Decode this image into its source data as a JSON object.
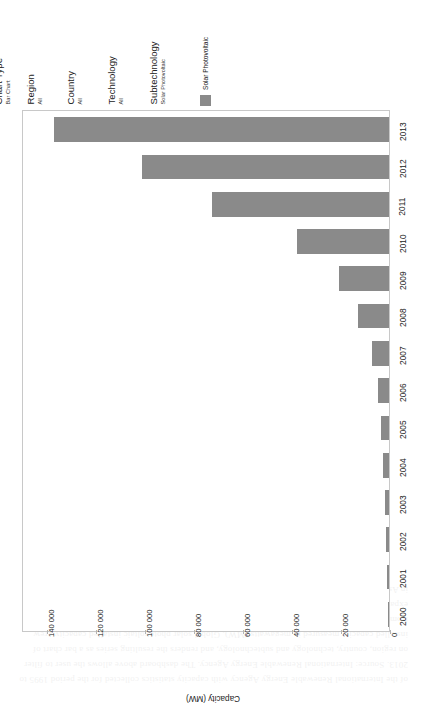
{
  "controls": [
    {
      "caption": "Chart Type",
      "value": "Bar Chart",
      "name": "chart-type"
    },
    {
      "caption": "Region",
      "value": "All",
      "name": "region"
    },
    {
      "caption": "Country",
      "value": "All",
      "name": "country"
    },
    {
      "caption": "Technology",
      "value": "All",
      "name": "technology"
    },
    {
      "caption": "Subtechnology",
      "value": "Solar Photovoltaic",
      "name": "subtechnology"
    }
  ],
  "legend": {
    "label": "Solar Photovoltaic",
    "swatch_color": "#8a8a8a"
  },
  "axis": {
    "value_title": "Capacity (MW)",
    "tick_labels": [
      "140 000",
      "120 000",
      "100 000",
      "80 000",
      "60 000",
      "40 000",
      "20 000",
      "0"
    ]
  },
  "chart_data": {
    "type": "bar",
    "orientation": "horizontal",
    "title": "",
    "subtitle": "",
    "xlabel": "Capacity (MW)",
    "ylabel": "",
    "xlim": [
      0,
      150000
    ],
    "ticks": [
      140000,
      120000,
      100000,
      80000,
      60000,
      40000,
      20000,
      0
    ],
    "grid": false,
    "legend_position": "top",
    "categories": [
      "2013",
      "2012",
      "2011",
      "2010",
      "2009",
      "2008",
      "2007",
      "2006",
      "2005",
      "2004",
      "2003",
      "2002",
      "2001",
      "2000"
    ],
    "series": [
      {
        "name": "Solar Photovoltaic",
        "color": "#8a8a8a",
        "values": [
          136500,
          100500,
          72000,
          37500,
          20300,
          12600,
          7100,
          4600,
          3300,
          2400,
          1600,
          1100,
          800,
          600
        ]
      }
    ]
  },
  "bleed_text": "of the International Renewable Energy Agency with capacity statistics collected for the period 1995 to 2013. Source: International Renewable Energy Agency. The dashboard above allows the user to filter on region, country, technology and subtechnology, and renders the resulting series as a bar chart of installed capacity measured in megawatts (MW). Global solar photovoltaic installed capacity grew from under one gigawatt at the turn of the century to well over one hundred gigawatts by 2013, an expansion driven principally by feed in tariff schemes in Europe and by rapid manufacturing scale up in Asia. The chart type selector may be switched between bar chart and line chart presentations."
}
